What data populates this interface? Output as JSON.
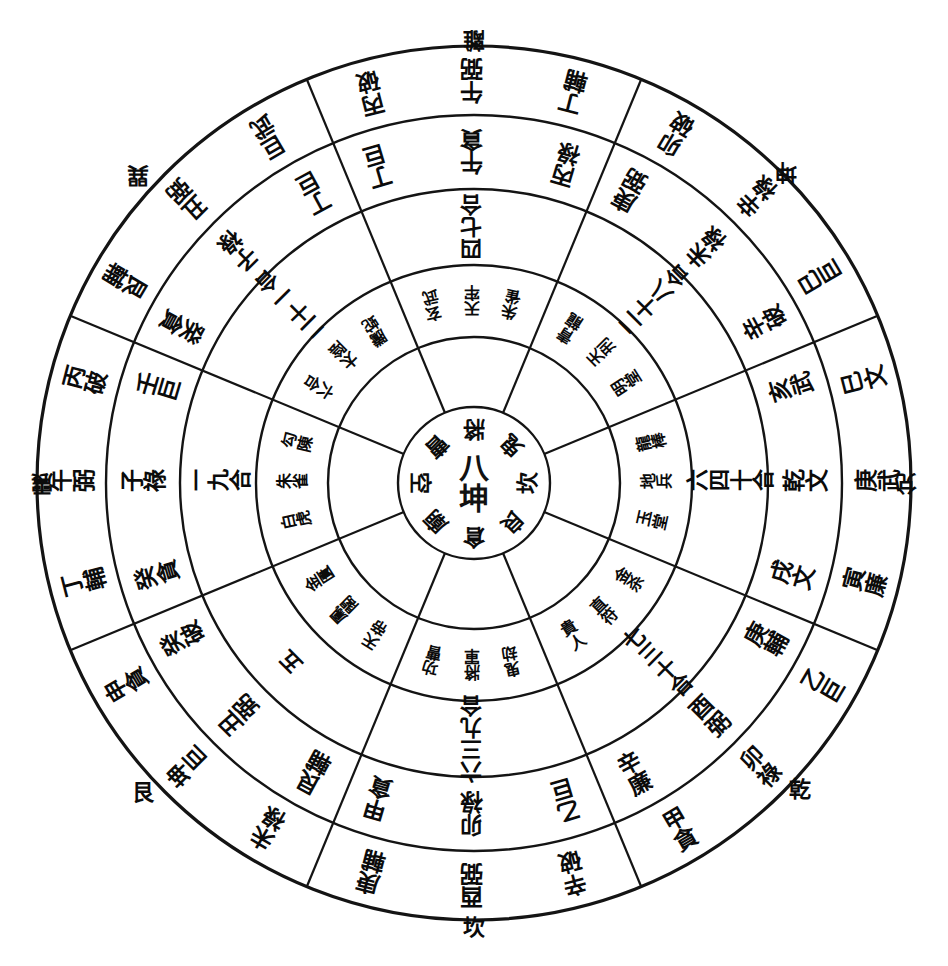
{
  "type": "luopan-compass-diagram",
  "geometry": {
    "cx": 474,
    "cy": 483,
    "radii": [
      76,
      146,
      218,
      294,
      368,
      437
    ],
    "sectors": 8,
    "sector_start_deg": -22.5,
    "stroke": "#141414",
    "background": "#ffffff"
  },
  "center": {
    "text": "八坤",
    "ring_labels": [
      "將",
      "鬼",
      "坎",
      "良",
      "倉",
      "廟",
      "空",
      "曹"
    ]
  },
  "outer_trigram_labels": [
    {
      "name": "li",
      "text": "離",
      "pos": "top",
      "rotate": 180
    },
    {
      "name": "kun",
      "text": "坤",
      "pos": "top-right",
      "rotate": 180
    },
    {
      "name": "dui",
      "text": "兌",
      "pos": "right",
      "rotate": 180
    },
    {
      "name": "qian",
      "text": "乾",
      "pos": "bottom-right",
      "rotate": 0
    },
    {
      "name": "kan",
      "text": "坎",
      "pos": "bottom",
      "rotate": 0
    },
    {
      "name": "gen",
      "text": "艮",
      "pos": "bottom-left",
      "rotate": 0
    },
    {
      "name": "zhen",
      "text": "震",
      "pos": "left",
      "rotate": 180
    },
    {
      "name": "xun",
      "text": "巽",
      "pos": "top-left",
      "rotate": 180
    }
  ],
  "rings": {
    "ring5_outer": {
      "name": "outermost-ring",
      "sectors": [
        {
          "dir": "N",
          "angle": 270,
          "rotate": 180,
          "cells": [
            "丁輔",
            "午弼",
            "丙破"
          ]
        },
        {
          "dir": "NE",
          "angle": 315,
          "rotate": 180,
          "cells": [
            "巳巨",
            "辛祿",
            "卯破"
          ]
        },
        {
          "dir": "E",
          "angle": 0,
          "rotate": 180,
          "cells": [
            "寅廉",
            "庚武",
            "巳文"
          ]
        },
        {
          "dir": "SE",
          "angle": 45,
          "rotate": 180,
          "cells": [
            "甲貪",
            "卯祿",
            "乙巨"
          ]
        },
        {
          "dir": "S",
          "angle": 90,
          "rotate": 0,
          "cells": [
            "辛破",
            "酉弼",
            "庚輔"
          ]
        },
        {
          "dir": "SW",
          "angle": 135,
          "rotate": 0,
          "cells": [
            "未祿",
            "坤巨",
            "申貪"
          ]
        },
        {
          "dir": "W",
          "angle": 180,
          "rotate": 0,
          "cells": [
            "丁輔",
            "午弼",
            "丙破"
          ]
        },
        {
          "dir": "NW",
          "angle": 225,
          "rotate": 180,
          "cells": [
            "巨武",
            "丑弼",
            "艮輔"
          ]
        }
      ]
    },
    "ring4": {
      "name": "fourth-ring",
      "sectors": [
        {
          "dir": "N",
          "angle": 270,
          "rotate": 180,
          "cells": [
            "丙祿",
            "午貪",
            "丁巨"
          ]
        },
        {
          "dir": "NE",
          "angle": 315,
          "rotate": 180,
          "cells": [
            "辛破",
            "未祿",
            "庚弼"
          ]
        },
        {
          "dir": "E",
          "angle": 0,
          "rotate": 180,
          "cells": [
            "戌文",
            "乾文",
            "亥武"
          ]
        },
        {
          "dir": "SE",
          "angle": 45,
          "rotate": 180,
          "cells": [
            "辛廉",
            "酉弼",
            "庚輔"
          ]
        },
        {
          "dir": "S",
          "angle": 90,
          "rotate": 0,
          "cells": [
            "乙巨",
            "卯祿",
            "甲貪"
          ]
        },
        {
          "dir": "SW",
          "angle": 135,
          "rotate": 0,
          "cells": [
            "艮輔",
            "丑弼",
            "癸破"
          ]
        },
        {
          "dir": "W",
          "angle": 180,
          "rotate": 0,
          "cells": [
            "癸貪",
            "子祿",
            "壬巨"
          ]
        },
        {
          "dir": "NW",
          "angle": 225,
          "rotate": 180,
          "cells": [
            "丁巨",
            "子祿",
            "癸貪"
          ]
        }
      ]
    },
    "ring3": {
      "name": "third-ring",
      "sectors": [
        {
          "dir": "N",
          "angle": 270,
          "rotate": 180,
          "text": "四七合"
        },
        {
          "dir": "NE",
          "angle": 315,
          "rotate": 180,
          "text": "二十八合"
        },
        {
          "dir": "E",
          "angle": 0,
          "rotate": 180,
          "text": "六四十合"
        },
        {
          "dir": "SE",
          "angle": 45,
          "rotate": 180,
          "text": "七三十合"
        },
        {
          "dir": "S",
          "angle": 90,
          "rotate": 0,
          "text": "六三九合"
        },
        {
          "dir": "SW",
          "angle": 135,
          "rotate": 0,
          "text": "五"
        },
        {
          "dir": "W",
          "angle": 180,
          "rotate": 0,
          "text": "一九合"
        },
        {
          "dir": "NW",
          "angle": 225,
          "rotate": 180,
          "text": "二十一合"
        }
      ]
    },
    "ring2": {
      "name": "second-ring",
      "sectors": [
        {
          "dir": "N",
          "angle": 270,
          "rotate": 180,
          "cols": [
            "朱雀",
            "天牢",
            "玄武"
          ]
        },
        {
          "dir": "NE",
          "angle": 315,
          "rotate": 180,
          "cols": [
            "明堂",
            "天刑",
            "青龍"
          ]
        },
        {
          "dir": "E",
          "angle": 0,
          "rotate": 180,
          "cols": [
            "玉堂",
            "地兵",
            "龍棒"
          ]
        },
        {
          "dir": "SE",
          "angle": 45,
          "rotate": 180,
          "cols": [
            "貴人",
            "直符",
            "金杀"
          ]
        },
        {
          "dir": "S",
          "angle": 90,
          "rotate": 0,
          "cols": [
            "鬼劫",
            "將軍",
            "功曹"
          ]
        },
        {
          "dir": "SW",
          "angle": 135,
          "rotate": 0,
          "cols": [
            "天帝",
            "鳳閣",
            "金匱"
          ]
        },
        {
          "dir": "W",
          "angle": 180,
          "rotate": 0,
          "cols": [
            "白虎",
            "朱雀",
            "勾陳"
          ]
        },
        {
          "dir": "NW",
          "angle": 225,
          "rotate": 180,
          "cols": [
            "騰蛇",
            "太陰",
            "六合"
          ]
        }
      ]
    }
  },
  "colors": {
    "ink": "#111111",
    "paper": "#ffffff",
    "line": "#1a1a1a"
  }
}
